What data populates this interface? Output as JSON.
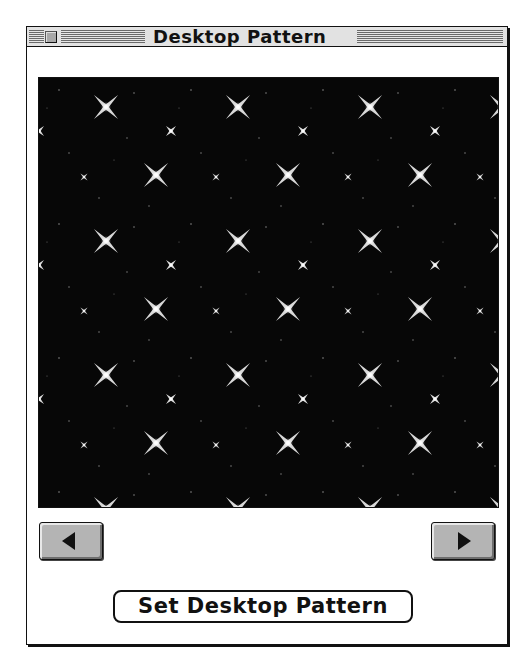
{
  "window": {
    "title": "Desktop Pattern",
    "close_icon": "close-box-icon"
  },
  "pattern": {
    "name": "starfield",
    "background_color": "#070707",
    "star_color": "#f2f2f2",
    "tile": {
      "width": 132,
      "height": 134
    }
  },
  "navigation": {
    "previous_icon": "left-arrow-icon",
    "next_icon": "right-arrow-icon"
  },
  "actions": {
    "set_label": "Set Desktop Pattern"
  }
}
